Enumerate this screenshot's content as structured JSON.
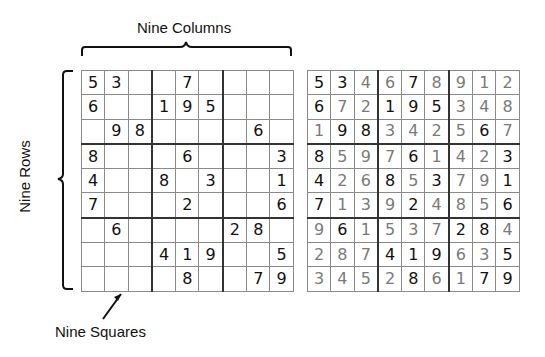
{
  "labels": {
    "columns": "Nine Columns",
    "rows": "Nine Rows",
    "squares": "Nine Squares"
  },
  "puzzle": [
    [
      "5",
      "3",
      "",
      "",
      "7",
      "",
      "",
      "",
      ""
    ],
    [
      "6",
      "",
      "",
      "1",
      "9",
      "5",
      "",
      "",
      ""
    ],
    [
      "",
      "9",
      "8",
      "",
      "",
      "",
      "",
      "6",
      ""
    ],
    [
      "8",
      "",
      "",
      "",
      "6",
      "",
      "",
      "",
      "3"
    ],
    [
      "4",
      "",
      "",
      "8",
      "",
      "3",
      "",
      "",
      "1"
    ],
    [
      "7",
      "",
      "",
      "",
      "2",
      "",
      "",
      "",
      "6"
    ],
    [
      "",
      "6",
      "",
      "",
      "",
      "",
      "2",
      "8",
      ""
    ],
    [
      "",
      "",
      "",
      "4",
      "1",
      "9",
      "",
      "",
      "5"
    ],
    [
      "",
      "",
      "",
      "",
      "8",
      "",
      "",
      "7",
      "9"
    ]
  ],
  "solution": [
    [
      "5",
      "3",
      "4",
      "6",
      "7",
      "8",
      "9",
      "1",
      "2"
    ],
    [
      "6",
      "7",
      "2",
      "1",
      "9",
      "5",
      "3",
      "4",
      "8"
    ],
    [
      "1",
      "9",
      "8",
      "3",
      "4",
      "2",
      "5",
      "6",
      "7"
    ],
    [
      "8",
      "5",
      "9",
      "7",
      "6",
      "1",
      "4",
      "2",
      "3"
    ],
    [
      "4",
      "2",
      "6",
      "8",
      "5",
      "3",
      "7",
      "9",
      "1"
    ],
    [
      "7",
      "1",
      "3",
      "9",
      "2",
      "4",
      "8",
      "5",
      "6"
    ],
    [
      "9",
      "6",
      "1",
      "5",
      "3",
      "7",
      "2",
      "8",
      "4"
    ],
    [
      "2",
      "8",
      "7",
      "4",
      "1",
      "9",
      "6",
      "3",
      "5"
    ],
    [
      "3",
      "4",
      "5",
      "2",
      "8",
      "6",
      "1",
      "7",
      "9"
    ]
  ],
  "colors": {
    "given_digit": "#111111",
    "filled_digit": "#7a7a7a",
    "grid_line": "#8a8a8a",
    "box_line": "#333333"
  }
}
